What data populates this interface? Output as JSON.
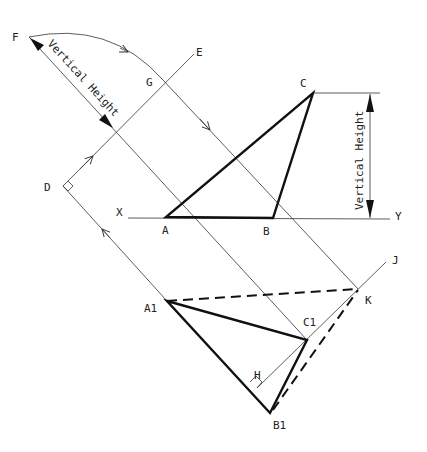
{
  "diagram": {
    "points": {
      "F": "F",
      "E": "E",
      "G": "G",
      "C": "C",
      "D": "D",
      "X": "X",
      "Y": "Y",
      "A": "A",
      "B": "B",
      "J": "J",
      "K": "K",
      "A1": "A1",
      "C1": "C1",
      "H": "H",
      "B1": "B1"
    },
    "annotations": {
      "vertical_height_diagonal": "Vertical Height",
      "vertical_height_right": "Vertical Height"
    },
    "colors": {
      "line": "#111111",
      "construction": "#333333",
      "background": "#ffffff"
    }
  }
}
